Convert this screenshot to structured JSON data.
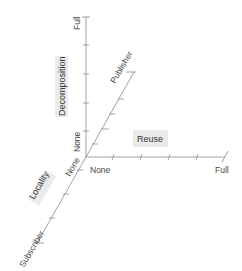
{
  "diagram": {
    "axes": {
      "decomposition": {
        "name": "Decomposition",
        "min_label": "None",
        "max_label": "Full"
      },
      "reuse": {
        "name": "Reuse",
        "min_label": "None",
        "max_label": "Full"
      },
      "locality": {
        "name": "Locality",
        "min_label": "None",
        "max_label": "Subscriber",
        "far_end_label": "Publisher"
      }
    },
    "colors": {
      "axis": "#8a8a8a",
      "label_box": "#ebebeb",
      "text": "#333333"
    }
  }
}
